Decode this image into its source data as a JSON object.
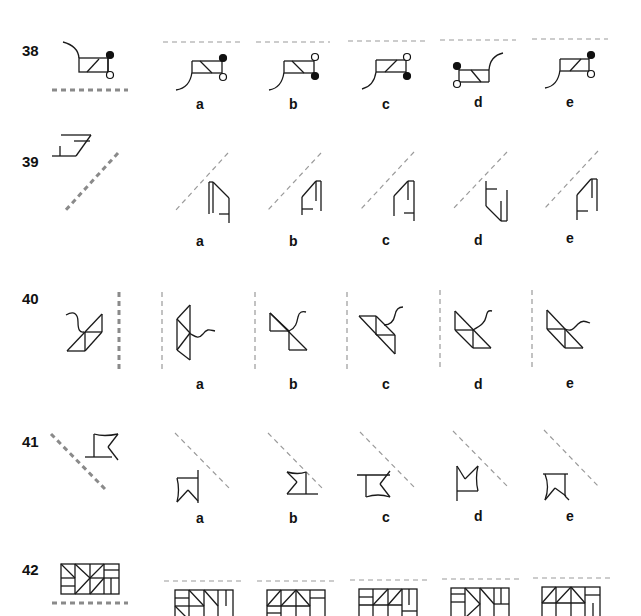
{
  "questions": [
    {
      "number": "38",
      "mirror": "horizontal-below",
      "options": [
        "a",
        "b",
        "c",
        "d",
        "e"
      ]
    },
    {
      "number": "39",
      "mirror": "diagonal-rising",
      "options": [
        "a",
        "b",
        "c",
        "d",
        "e"
      ]
    },
    {
      "number": "40",
      "mirror": "vertical-right",
      "options": [
        "a",
        "b",
        "c",
        "d",
        "e"
      ]
    },
    {
      "number": "41",
      "mirror": "diagonal-falling",
      "options": [
        "a",
        "b",
        "c",
        "d",
        "e"
      ]
    },
    {
      "number": "42",
      "mirror": "horizontal-below",
      "options": [
        "a",
        "b",
        "c",
        "d",
        "e"
      ]
    }
  ],
  "colors": {
    "line": "#1a1a1a",
    "mirror_question": "#8a8a8a",
    "mirror_option": "#9a9a9a",
    "background": "#ffffff"
  }
}
